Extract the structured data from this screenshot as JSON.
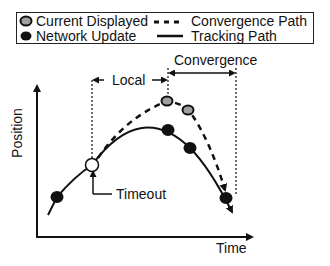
{
  "legend": {
    "current_displayed": "Current Displayed",
    "network_update": "Network Update",
    "convergence_path": "Convergence Path",
    "tracking_path": "Tracking Path"
  },
  "annotations": {
    "convergence": "Convergence",
    "local": "Local",
    "timeout": "Timeout"
  },
  "axes": {
    "x_label": "Time",
    "y_label": "Position"
  },
  "colors": {
    "current_displayed_fill": "#a0a0a0",
    "network_update_fill": "#111111",
    "timeout_fill": "#ffffff",
    "line": "#111111"
  },
  "points": {
    "timeout": {
      "x": 92,
      "y": 165
    },
    "current_displayed": [
      {
        "x": 167,
        "y": 101
      },
      {
        "x": 188,
        "y": 110
      }
    ],
    "network_update": [
      {
        "x": 57,
        "y": 197
      },
      {
        "x": 168,
        "y": 130
      },
      {
        "x": 190,
        "y": 148
      },
      {
        "x": 226,
        "y": 198
      }
    ]
  }
}
